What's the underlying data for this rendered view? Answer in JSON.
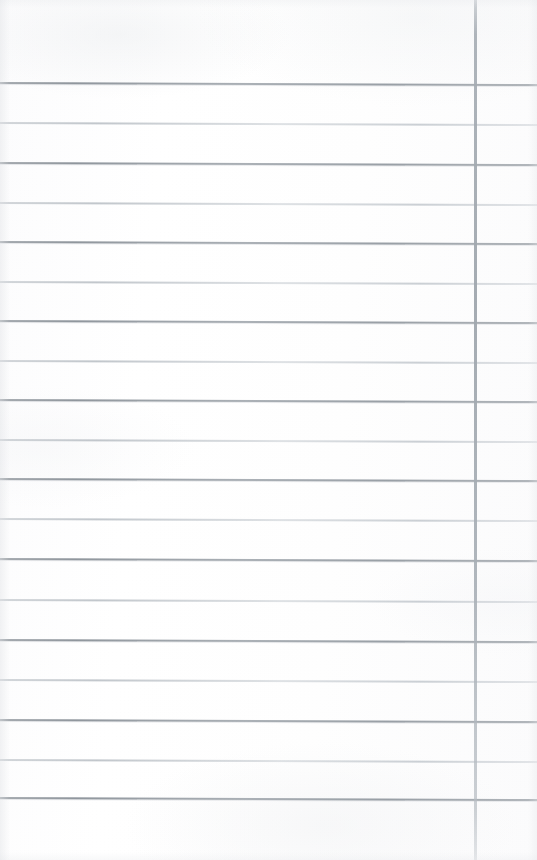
{
  "document": {
    "kind": "scanned-page",
    "title": "Blank ruled notebook page",
    "description": "Scanned blank sheet of ruled (lined) notebook paper with a single vertical margin rule near the right edge. No handwriting or printed text is present.",
    "page_width": 537,
    "page_height": 860,
    "orientation": "portrait",
    "text_content": "",
    "colors": {
      "paper": "#fdfdfe",
      "rule_dark": "#8f959c",
      "rule_light": "#c2c7cc",
      "margin_rule": "#a6adb4",
      "edge_shadow": "#e3e5e8"
    },
    "header_space": {
      "label": "blank top margin",
      "height": 83
    },
    "footer_space": {
      "label": "blank bottom margin",
      "height": 62
    },
    "margin_rule": {
      "label": "vertical margin rule",
      "orientation": "vertical",
      "x": 475,
      "width": 3,
      "from_y": 0,
      "to_y": 860,
      "weight": "medium"
    },
    "ruling": {
      "label": "horizontal ruled lines",
      "count": 19,
      "spacing": 39.8,
      "first_y": 83,
      "last_y": 798,
      "skew_px": 2,
      "lines": [
        {
          "index": 1,
          "y": 83,
          "weight": "dark"
        },
        {
          "index": 2,
          "y": 123,
          "weight": "light"
        },
        {
          "index": 3,
          "y": 163,
          "weight": "dark"
        },
        {
          "index": 4,
          "y": 203,
          "weight": "light"
        },
        {
          "index": 5,
          "y": 242,
          "weight": "dark"
        },
        {
          "index": 6,
          "y": 282,
          "weight": "light"
        },
        {
          "index": 7,
          "y": 321,
          "weight": "dark"
        },
        {
          "index": 8,
          "y": 361,
          "weight": "light"
        },
        {
          "index": 9,
          "y": 400,
          "weight": "dark"
        },
        {
          "index": 10,
          "y": 440,
          "weight": "light"
        },
        {
          "index": 11,
          "y": 479,
          "weight": "dark"
        },
        {
          "index": 12,
          "y": 519,
          "weight": "light"
        },
        {
          "index": 13,
          "y": 559,
          "weight": "dark"
        },
        {
          "index": 14,
          "y": 600,
          "weight": "light"
        },
        {
          "index": 15,
          "y": 640,
          "weight": "dark"
        },
        {
          "index": 16,
          "y": 680,
          "weight": "light"
        },
        {
          "index": 17,
          "y": 720,
          "weight": "dark"
        },
        {
          "index": 18,
          "y": 760,
          "weight": "light"
        },
        {
          "index": 19,
          "y": 798,
          "weight": "dark"
        }
      ]
    },
    "regions": [
      {
        "name": "writing-area",
        "label": "writing area",
        "x": 0,
        "width": 474
      },
      {
        "name": "margin-area",
        "label": "right margin column",
        "x": 477,
        "width": 60
      }
    ]
  }
}
